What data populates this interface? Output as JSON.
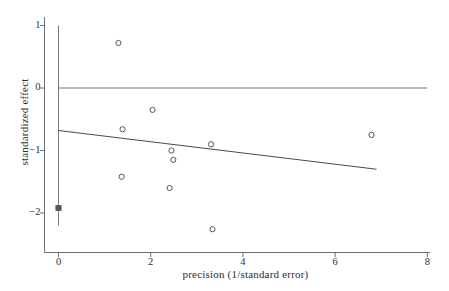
{
  "chart_data": {
    "type": "scatter",
    "title": "",
    "xlabel": "precision (1/standard error)",
    "ylabel": "standardized effect",
    "xlim": [
      -0.35,
      8.2
    ],
    "ylim": [
      -2.45,
      1.1
    ],
    "grid": false,
    "legend": null,
    "xticks": [
      0,
      2,
      4,
      6,
      8
    ],
    "xticklabels": [
      "0",
      "2",
      "4",
      "6",
      "8"
    ],
    "yticks": [
      1,
      0,
      -1,
      -2
    ],
    "yticklabels": [
      "1",
      "0",
      "−1",
      "−2"
    ],
    "points": [
      {
        "x": 1.3,
        "y": 0.72,
        "marker": "open-circle"
      },
      {
        "x": 2.04,
        "y": -0.35,
        "marker": "open-circle"
      },
      {
        "x": 1.39,
        "y": -0.66,
        "marker": "open-circle"
      },
      {
        "x": 6.79,
        "y": -0.75,
        "marker": "open-circle"
      },
      {
        "x": 3.31,
        "y": -0.9,
        "marker": "open-circle"
      },
      {
        "x": 2.45,
        "y": -1.0,
        "marker": "open-circle"
      },
      {
        "x": 2.49,
        "y": -1.15,
        "marker": "open-circle"
      },
      {
        "x": 1.37,
        "y": -1.42,
        "marker": "open-circle"
      },
      {
        "x": 2.41,
        "y": -1.6,
        "marker": "open-circle"
      },
      {
        "x": 3.34,
        "y": -2.26,
        "marker": "open-circle"
      },
      {
        "x": 0.0,
        "y": -1.92,
        "marker": "filled-square"
      }
    ],
    "reference_line": {
      "name": "zero-effect-line",
      "orientation": "horizontal",
      "y": 0.0,
      "x_from": 0.0,
      "x_to": 8.0
    },
    "vertical_line": {
      "name": "summary-error-bar",
      "orientation": "vertical",
      "x": 0.0,
      "y_from": -2.2,
      "y_to": 1.0
    },
    "regression_line": {
      "name": "egger-regression-line",
      "x_from": 0.0,
      "y_from": -0.68,
      "x_to": 6.9,
      "y_to": -1.3
    },
    "series": [
      {
        "name": "studies",
        "x": [
          1.3,
          2.04,
          1.39,
          6.79,
          3.31,
          2.45,
          2.49,
          1.37,
          2.41,
          3.34
        ],
        "values": [
          0.72,
          -0.35,
          -0.66,
          -0.75,
          -0.9,
          -1.0,
          -1.15,
          -1.42,
          -1.6,
          -2.26
        ]
      },
      {
        "name": "summary",
        "x": [
          0.0
        ],
        "values": [
          -1.92
        ]
      }
    ]
  },
  "colors": {
    "axis": "#6d6d6d",
    "point_stroke": "#555555",
    "reference_line": "#7a7a7a",
    "regression_line": "#4a4a4a",
    "text": "#2e2e2e",
    "background": "#ffffff"
  }
}
